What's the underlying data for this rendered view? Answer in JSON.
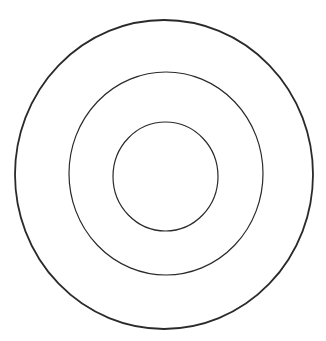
{
  "diagram": {
    "type": "concentric-circles",
    "background": "#ffffff",
    "stroke_color": "#2a2a2a",
    "rings": [
      {
        "name": "outer-ring",
        "cx": 164,
        "cy": 174.5,
        "rx": 149,
        "ry": 154.5,
        "stroke_width": 1.8
      },
      {
        "name": "middle-ring",
        "cx": 166,
        "cy": 173.5,
        "rx": 97,
        "ry": 101.5,
        "stroke_width": 1.2
      },
      {
        "name": "inner-ring",
        "cx": 165.5,
        "cy": 176.5,
        "rx": 52.5,
        "ry": 54.5,
        "stroke_width": 1.2
      }
    ]
  }
}
